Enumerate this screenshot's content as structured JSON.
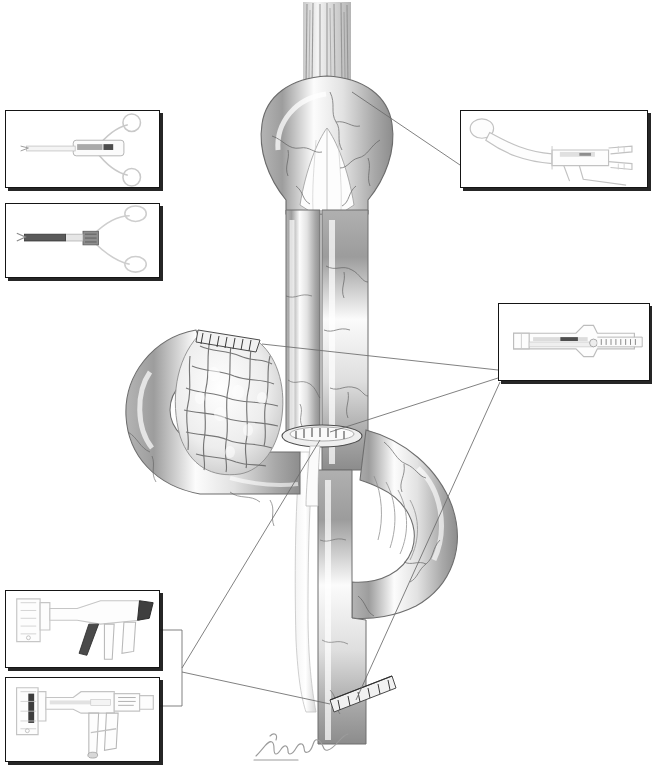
{
  "figure": {
    "medium": "graphite pencil medical illustration",
    "background_color": "#ffffff",
    "ink_color": "#151515",
    "shading_color": "#9a9a9a",
    "width": 652,
    "height": 769,
    "watermark_text": "",
    "artist_signature": "Radoski"
  },
  "anatomy": {
    "label": "small bowel loops with stapled anastomosis",
    "parts": [
      {
        "name": "mesenteric-vessel-bundle",
        "description": "vertical striated vascular pedicle at top"
      },
      {
        "name": "proximal-bowel-loop",
        "description": "inverted U shaped bowel loop at top"
      },
      {
        "name": "descending-limb-left",
        "description": "left vertical bowel limb"
      },
      {
        "name": "descending-limb-right",
        "description": "right vertical bowel limb"
      },
      {
        "name": "opened-bowel-mucosa",
        "description": "cut open bowel showing cobblestone mucosal folds"
      },
      {
        "name": "transverse-bowel-loop",
        "description": "horizontal bowel curving left"
      },
      {
        "name": "distal-bowel-loop",
        "description": "lower bowel loop curving right"
      },
      {
        "name": "anastomotic-staple-line-central",
        "description": "elliptical staple line on central limb"
      },
      {
        "name": "staple-line-proximal-cut-end",
        "description": "staple row at opened proximal bowel end"
      },
      {
        "name": "staple-line-distal-transection",
        "description": "oblique staple row at distal bowel"
      }
    ]
  },
  "insets": [
    {
      "id": "inset-scissors-upper-left",
      "name": "inset-surgical-scissors",
      "instrument": "ring-handled surgical scissors / dissector",
      "x": 5,
      "y": 110,
      "width": 155,
      "height": 78
    },
    {
      "id": "inset-grasper-left",
      "name": "inset-surgical-grasper",
      "instrument": "ring-handled grasping forceps with dark shaft",
      "x": 5,
      "y": 203,
      "width": 155,
      "height": 75
    },
    {
      "id": "inset-curved-stapler-top-right",
      "name": "inset-curved-stapler",
      "instrument": "curved circular stapler with trigger handle",
      "x": 460,
      "y": 110,
      "width": 188,
      "height": 78
    },
    {
      "id": "inset-linear-stapler-right",
      "name": "inset-linear-stapler",
      "instrument": "linear cutting stapler cartridge",
      "x": 498,
      "y": 303,
      "width": 152,
      "height": 78
    },
    {
      "id": "inset-stapler-gun-upper",
      "name": "inset-stapler-gun-open",
      "instrument": "linear stapler gun, jaws open",
      "x": 5,
      "y": 590,
      "width": 155,
      "height": 78
    },
    {
      "id": "inset-stapler-gun-lower",
      "name": "inset-stapler-gun-closed",
      "instrument": "linear stapler gun, loaded cartridge",
      "x": 5,
      "y": 677,
      "width": 155,
      "height": 85
    }
  ],
  "leaders": [
    {
      "name": "leader-curved-stapler",
      "from_inset": "inset-curved-stapler-top-right",
      "to_anatomy": "proximal-bowel-loop"
    },
    {
      "name": "leader-linear-stapler-upper",
      "from_inset": "inset-linear-stapler-right",
      "to_anatomy": "staple-line-proximal-cut-end"
    },
    {
      "name": "leader-linear-stapler-lower",
      "from_inset": "inset-linear-stapler-right",
      "to_anatomy": "staple-line-distal-transection"
    },
    {
      "name": "leader-stapler-guns-bracket",
      "from_inset": "inset-stapler-gun-upper",
      "to_anatomy": "anastomotic-staple-line-central"
    }
  ]
}
